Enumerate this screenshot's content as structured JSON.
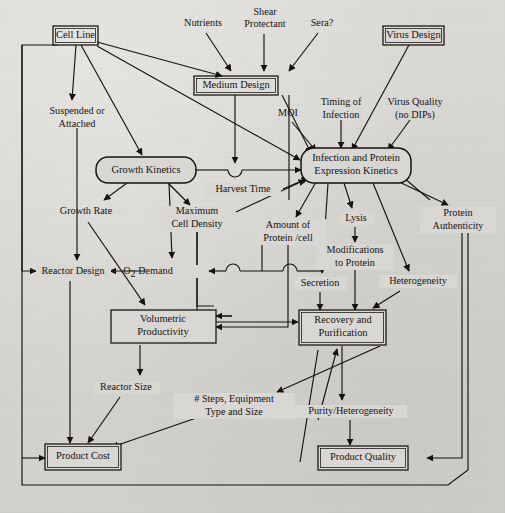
{
  "figure": {
    "type": "flow-diagram",
    "background_color": "#d9d7d3",
    "ink_color": "#15120e"
  },
  "nodes": {
    "cell_line": {
      "label": "Cell Line",
      "shape": "double-rect",
      "x": 75,
      "y": 35
    },
    "nutrients": {
      "label": "Nutrients",
      "shape": "plain",
      "x": 203,
      "y": 23
    },
    "shear_protectant": {
      "label_line1": "Shear",
      "label_line2": "Protectant",
      "shape": "plain",
      "x": 265,
      "y": 17
    },
    "sera": {
      "label": "Sera?",
      "shape": "plain",
      "x": 322,
      "y": 23
    },
    "virus_design": {
      "label": "Virus Design",
      "shape": "double-rect",
      "x": 417,
      "y": 35
    },
    "medium_design": {
      "label": "Medium Design",
      "shape": "double-rect",
      "x": 235,
      "y": 85
    },
    "suspended_or_attached": {
      "label_line1": "Suspended or",
      "label_line2": "Attached",
      "shape": "plain",
      "x": 77,
      "y": 116
    },
    "moi": {
      "label": "MOI",
      "shape": "plain",
      "x": 289,
      "y": 113
    },
    "timing_of_infection": {
      "label_line1": "Timing of",
      "label_line2": "Infection",
      "shape": "plain",
      "x": 341,
      "y": 107
    },
    "virus_quality": {
      "label_line1": "Virus Quality",
      "label_line2": "(no DIPs)",
      "shape": "plain",
      "x": 414,
      "y": 107
    },
    "growth_kinetics": {
      "label": "Growth Kinetics",
      "shape": "rounded",
      "x": 144,
      "y": 170
    },
    "infection_expression": {
      "label_line1": "Infection and Protein",
      "label_line2": "Expression Kinetics",
      "shape": "rounded",
      "x": 355,
      "y": 166
    },
    "harvest_time": {
      "label": "Harvest Time",
      "shape": "plain",
      "x": 243,
      "y": 190
    },
    "growth_rate": {
      "label": "Growth Rate",
      "shape": "plain",
      "x": 86,
      "y": 211
    },
    "maximum_cell_density": {
      "label_line1": "Maximum",
      "label_line2": "Cell Density",
      "shape": "plain",
      "x": 197,
      "y": 217
    },
    "amount_of_protein": {
      "label_line1": "Amount of",
      "label_line2": "Protein /cell",
      "shape": "plain",
      "x": 288,
      "y": 230
    },
    "lysis": {
      "label": "Lysis",
      "shape": "plain",
      "x": 356,
      "y": 218
    },
    "protein_authenticity": {
      "label_line1": "Protein",
      "label_line2": "Authenticity",
      "shape": "plain",
      "x": 458,
      "y": 219
    },
    "modifications_to_protein": {
      "label_line1": "Modifications",
      "label_line2": "to Protein",
      "shape": "plain",
      "x": 355,
      "y": 252
    },
    "heterogeneity": {
      "label": "Heterogeneity",
      "shape": "plain",
      "x": 418,
      "y": 281
    },
    "secretion": {
      "label": "Secretion",
      "shape": "plain",
      "x": 320,
      "y": 283
    },
    "reactor_design": {
      "label": "Reactor Design",
      "shape": "plain",
      "x": 70,
      "y": 271
    },
    "o2_demand": {
      "label_main": "O",
      "label_sub": "2",
      "label_rest": " Demand",
      "shape": "plain",
      "x": 176,
      "y": 271
    },
    "volumetric_productivity": {
      "label_line1": "Volumetric",
      "label_line2": "Productivity",
      "shape": "rect",
      "x": 154,
      "y": 327
    },
    "recovery_purification": {
      "label_line1": "Recovery and",
      "label_line2": "Purification",
      "shape": "rect",
      "x": 342,
      "y": 327
    },
    "reactor_size": {
      "label": "Reactor Size",
      "shape": "plain",
      "x": 125,
      "y": 387
    },
    "steps_equipment": {
      "label_line1": "# Steps, Equipment",
      "label_line2": "Type and Size",
      "shape": "plain",
      "x": 234,
      "y": 404
    },
    "purity_heterogeneity": {
      "label": "Purity/Heterogeneity",
      "shape": "plain",
      "x": 350,
      "y": 411
    },
    "product_cost": {
      "label": "Product Cost",
      "shape": "double-rect",
      "x": 73,
      "y": 458
    },
    "product_quality": {
      "label": "Product Quality",
      "shape": "double-rect",
      "x": 385,
      "y": 458
    }
  },
  "edges": [
    {
      "from": "cell_line",
      "to": "medium_design"
    },
    {
      "from": "cell_line",
      "to": "suspended_or_attached"
    },
    {
      "from": "cell_line",
      "to": "growth_kinetics"
    },
    {
      "from": "cell_line",
      "to": "infection_expression"
    },
    {
      "from": "nutrients",
      "to": "medium_design"
    },
    {
      "from": "shear_protectant",
      "to": "medium_design"
    },
    {
      "from": "sera",
      "to": "medium_design"
    },
    {
      "from": "medium_design",
      "to": "growth_kinetics"
    },
    {
      "from": "medium_design",
      "to": "infection_expression"
    },
    {
      "from": "virus_design",
      "to": "infection_expression"
    },
    {
      "from": "moi",
      "to": "infection_expression"
    },
    {
      "from": "timing_of_infection",
      "to": "infection_expression"
    },
    {
      "from": "virus_quality",
      "to": "infection_expression"
    },
    {
      "from": "growth_kinetics",
      "to": "infection_expression"
    },
    {
      "from": "growth_kinetics",
      "to": "growth_rate"
    },
    {
      "from": "growth_kinetics",
      "to": "maximum_cell_density"
    },
    {
      "from": "growth_kinetics",
      "to": "o2_demand"
    },
    {
      "from": "harvest_time",
      "to": "infection_expression"
    },
    {
      "from": "maximum_cell_density",
      "to": "infection_expression"
    },
    {
      "from": "infection_expression",
      "to": "amount_of_protein"
    },
    {
      "from": "infection_expression",
      "to": "lysis"
    },
    {
      "from": "infection_expression",
      "to": "heterogeneity"
    },
    {
      "from": "infection_expression",
      "to": "protein_authenticity"
    },
    {
      "from": "infection_expression",
      "to": "secretion"
    },
    {
      "from": "lysis",
      "to": "modifications_to_protein"
    },
    {
      "from": "suspended_or_attached",
      "to": "reactor_design"
    },
    {
      "from": "cell_line",
      "to": "reactor_design"
    },
    {
      "from": "o2_demand",
      "to": "reactor_design"
    },
    {
      "from": "growth_rate",
      "to": "volumetric_productivity"
    },
    {
      "from": "maximum_cell_density",
      "to": "volumetric_productivity"
    },
    {
      "from": "amount_of_protein",
      "to": "volumetric_productivity"
    },
    {
      "from": "reactor_design",
      "to": "product_cost"
    },
    {
      "from": "volumetric_productivity",
      "to": "reactor_size"
    },
    {
      "from": "volumetric_productivity",
      "to": "recovery_purification"
    },
    {
      "from": "secretion",
      "to": "recovery_purification"
    },
    {
      "from": "modifications_to_protein",
      "to": "recovery_purification"
    },
    {
      "from": "heterogeneity",
      "to": "recovery_purification"
    },
    {
      "from": "recovery_purification",
      "to": "purity_heterogeneity"
    },
    {
      "from": "recovery_purification",
      "to": "steps_equipment"
    },
    {
      "from": "reactor_size",
      "to": "product_cost"
    },
    {
      "from": "steps_equipment",
      "to": "product_cost"
    },
    {
      "from": "purity_heterogeneity",
      "to": "product_quality"
    },
    {
      "from": "protein_authenticity",
      "to": "product_quality"
    },
    {
      "from": "product_quality",
      "to": "product_cost",
      "note": "bottom feedback loop"
    }
  ]
}
